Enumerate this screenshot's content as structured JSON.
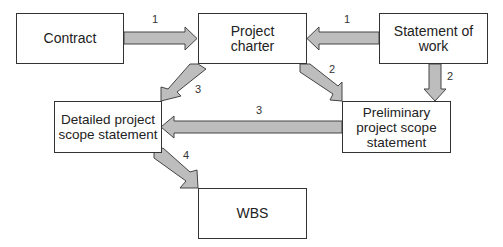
{
  "diagram": {
    "nodes": [
      {
        "id": "contract",
        "label": "Contract"
      },
      {
        "id": "project-charter",
        "label": "Project charter"
      },
      {
        "id": "statement-of-work",
        "label": "Statement of work"
      },
      {
        "id": "detailed-scope",
        "label": "Detailed project scope statement"
      },
      {
        "id": "preliminary-scope",
        "label": "Preliminary project scope statement"
      },
      {
        "id": "wbs",
        "label": "WBS"
      }
    ],
    "edges": [
      {
        "from": "contract",
        "to": "project-charter",
        "label": "1"
      },
      {
        "from": "statement-of-work",
        "to": "project-charter",
        "label": "1"
      },
      {
        "from": "project-charter",
        "to": "preliminary-scope",
        "label": "2"
      },
      {
        "from": "statement-of-work",
        "to": "preliminary-scope",
        "label": "2"
      },
      {
        "from": "project-charter",
        "to": "detailed-scope",
        "label": "3"
      },
      {
        "from": "preliminary-scope",
        "to": "detailed-scope",
        "label": "3"
      },
      {
        "from": "detailed-scope",
        "to": "wbs",
        "label": "4"
      }
    ],
    "colors": {
      "arrow_fill": "#bdbdbd",
      "arrow_stroke": "#444444",
      "box_border": "#333333"
    }
  }
}
